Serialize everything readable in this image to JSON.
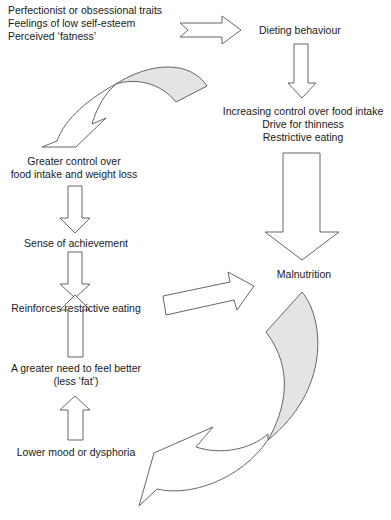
{
  "diagram": {
    "type": "flow-cycle",
    "colors": {
      "arrow_fill": "#ffffff",
      "arrow_stroke": "#555555",
      "shaded_fill": "#e4e4e4",
      "text": "#1a1a1a"
    },
    "nodes": {
      "risk_factors": {
        "lines": [
          "Perfectionist or obsessional traits",
          "Feelings of low self-esteem",
          "Perceived ‘fatness’"
        ]
      },
      "dieting": {
        "lines": [
          "Dieting behaviour"
        ]
      },
      "control": {
        "lines": [
          "Increasing control over food intake",
          "Drive for thinness",
          "Restrictive eating"
        ]
      },
      "malnutrition": {
        "lines": [
          "Malnutrition"
        ]
      },
      "greater_control": {
        "lines": [
          "Greater control over",
          "food intake and weight loss"
        ]
      },
      "achievement": {
        "lines": [
          "Sense of achievement"
        ]
      },
      "reinforces": {
        "lines": [
          "Reinforces restrictive eating"
        ]
      },
      "need_better": {
        "lines": [
          "A greater need to feel better",
          "(less ‘fat’)"
        ]
      },
      "lower_mood": {
        "lines": [
          "Lower mood or dysphoria"
        ]
      }
    },
    "edges": [
      {
        "from": "risk_factors",
        "to": "dieting",
        "style": "block-arrow-right"
      },
      {
        "from": "dieting",
        "to": "control",
        "style": "block-arrow-down"
      },
      {
        "from": "control",
        "to": "malnutrition",
        "style": "block-arrow-down-large"
      },
      {
        "from": "control",
        "to": "greater_control",
        "style": "curved-arrow-shaded"
      },
      {
        "from": "greater_control",
        "to": "achievement",
        "style": "block-arrow-down"
      },
      {
        "from": "achievement",
        "to": "reinforces",
        "style": "block-arrow-down"
      },
      {
        "from": "reinforces",
        "to": "malnutrition",
        "style": "block-arrow-slanted"
      },
      {
        "from": "need_better",
        "to": "reinforces",
        "style": "block-arrow-up"
      },
      {
        "from": "lower_mood",
        "to": "need_better",
        "style": "block-arrow-up"
      },
      {
        "from": "malnutrition",
        "to": "lower_mood",
        "style": "curved-arrow-shaded"
      }
    ]
  }
}
